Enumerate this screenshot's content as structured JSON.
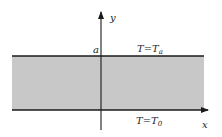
{
  "diagram": {
    "axes": {
      "x_label": "x",
      "y_label": "y"
    },
    "labels": {
      "height_marker": "a",
      "top_boundary": {
        "var": "T",
        "eq": "=",
        "base": "T",
        "sub": "a"
      },
      "bottom_boundary": {
        "var": "T",
        "eq": "=",
        "base": "T",
        "sub": "0"
      }
    },
    "colors": {
      "band": "#c8c8c8",
      "lines": "#1a1a1a"
    }
  }
}
